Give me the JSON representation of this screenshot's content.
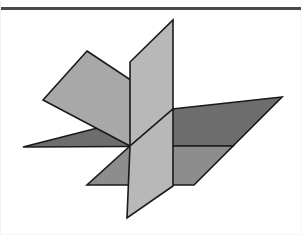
{
  "page": {
    "background_color": "#ffffff",
    "width": 301,
    "height": 235
  },
  "top_rule": {
    "name": "horizontal-rule",
    "color": "#4a4a4a",
    "y": 7,
    "thickness": 3,
    "x_start": 0,
    "x_end": 301
  },
  "figure": {
    "type": "geometric-diagram",
    "center_point": [
      129,
      146
    ],
    "outline_color": "#1a1a1a",
    "outline_width": 1.6,
    "faces": [
      {
        "name": "upper-left-plane-light",
        "label": "Upper left horizontal-ish plane (light gray)",
        "fill": "#a8a8a8",
        "points": "86,51 172,108 129,146 42,100"
      },
      {
        "name": "horizontal-plane-dark",
        "label": "Horizontal plane (dark gray)",
        "fill": "#6d6d6d",
        "points": "22,147 171,109 281,97 232,146"
      },
      {
        "name": "lower-right-plane-medium",
        "label": "Lower right plane (medium gray)",
        "fill": "#8d8d8d",
        "points": "129,146 232,146 193,185 86,185"
      },
      {
        "name": "vertical-plane-upper-light",
        "label": "Vertical plane upper half (lightest gray)",
        "fill": "#b8b8b8",
        "points": "172,20 172,109 129,146 129,62"
      },
      {
        "name": "vertical-plane-lower-light",
        "label": "Vertical plane lower half (lightest gray)",
        "fill": "#b8b8b8",
        "points": "129,146 172,109 172,186 126,218"
      }
    ],
    "vertices": {
      "vertical_plane_top_apex": [
        172,
        20
      ],
      "vertical_plane_upper_left": [
        129,
        62
      ],
      "vertical_plane_bottom_tip": [
        126,
        218
      ],
      "left_plane_top": [
        86,
        51
      ],
      "left_plane_left": [
        42,
        100
      ],
      "dark_plane_left": [
        22,
        147
      ],
      "dark_plane_right": [
        281,
        97
      ],
      "medium_plane_right": [
        232,
        146
      ],
      "medium_plane_bottom": [
        193,
        185
      ]
    },
    "palette": {
      "lightest_gray": "#b8b8b8",
      "light_gray": "#a8a8a8",
      "medium_gray": "#8d8d8d",
      "dark_gray": "#6d6d6d",
      "outline": "#1a1a1a",
      "rule": "#4a4a4a"
    }
  }
}
